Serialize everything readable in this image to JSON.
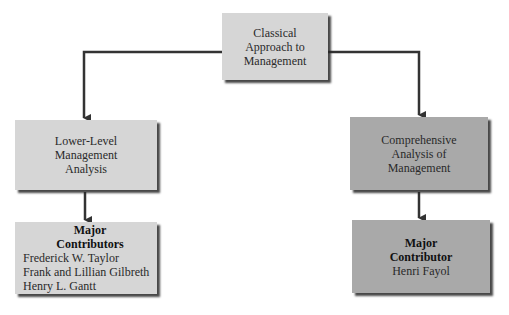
{
  "diagram": {
    "root": {
      "lines": [
        "Classical",
        "Approach to",
        "Management"
      ]
    },
    "left_branch": {
      "lines": [
        "Lower-Level",
        "Management",
        "Analysis"
      ],
      "contributors": {
        "heading": [
          "Major",
          "Contributors"
        ],
        "names": [
          "Frederick W. Taylor",
          "Frank and Lillian Gilbreth",
          "Henry L. Gantt"
        ]
      }
    },
    "right_branch": {
      "lines": [
        "Comprehensive",
        "Analysis of",
        "Management"
      ],
      "contributors": {
        "heading": [
          "Major",
          "Contributor"
        ],
        "names": [
          "Henri Fayol"
        ]
      }
    },
    "colors": {
      "light_box": "#d6d6d6",
      "dark_box": "#a9a9a9",
      "connector": "#333333"
    }
  }
}
